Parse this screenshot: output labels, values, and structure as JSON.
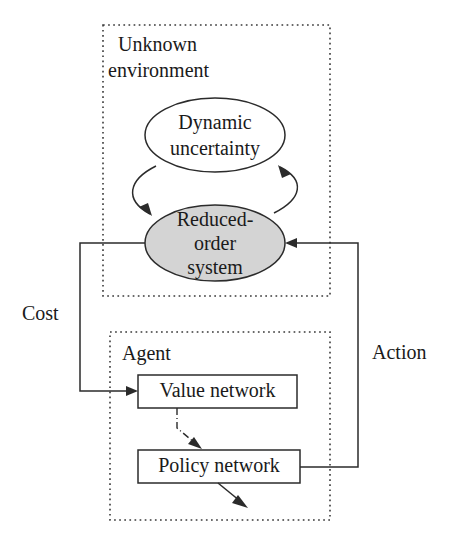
{
  "figure": {
    "kind": "block-diagram",
    "width": 455,
    "height": 544,
    "background": "#ffffff",
    "line_color": "#2b2b2b",
    "accent_fill": "#d4d4d4"
  },
  "groups": {
    "environment": {
      "title": "Unknown\nenvironment",
      "title_line1": "Unknown",
      "title_line2": "environment",
      "border_style": "dotted"
    },
    "agent": {
      "title": "Agent",
      "border_style": "dotted"
    }
  },
  "nodes": {
    "dynamic_uncertainty": {
      "shape": "ellipse",
      "fill": "#ffffff",
      "line1": "Dynamic",
      "line2": "uncertainty"
    },
    "reduced_order_system": {
      "shape": "ellipse",
      "fill": "#d4d4d4",
      "line1": "Reduced-",
      "line2": "order",
      "line3": "system"
    },
    "value_network": {
      "shape": "rect",
      "fill": "#ffffff",
      "label": "Value network"
    },
    "policy_network": {
      "shape": "rect",
      "fill": "#ffffff",
      "label": "Policy network"
    }
  },
  "edges": {
    "cost": {
      "label": "Cost",
      "from": "reduced_order_system",
      "to": "value_network"
    },
    "action": {
      "label": "Action",
      "from": "policy_network",
      "to": "reduced_order_system"
    },
    "uncertainty_to_system": {
      "label": "",
      "style": "curved-arrow"
    },
    "system_to_uncertainty": {
      "label": "",
      "style": "curved-arrow"
    },
    "value_to_policy": {
      "label": "",
      "style": "dash-dot"
    },
    "policy_output": {
      "label": "",
      "style": "short-arrow"
    }
  }
}
